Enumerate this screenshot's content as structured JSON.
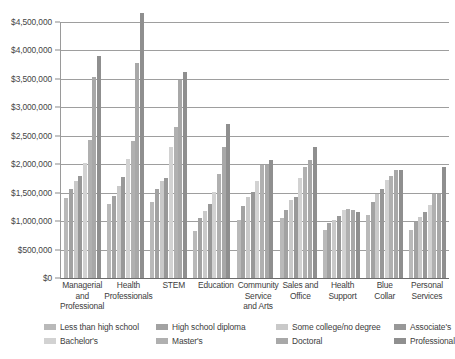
{
  "chart_data": {
    "type": "bar",
    "title": "",
    "subtitle": "",
    "xlabel": "",
    "ylabel": "",
    "ylim": [
      0,
      4500000
    ],
    "y_tick_labels": [
      "$0",
      "$500,000",
      "$1,000,000",
      "$1,500,000",
      "$2,000,000",
      "$2,500,000",
      "$3,000,000",
      "$3,500,000",
      "$4,000,000",
      "$4,500,000"
    ],
    "y_tick_values": [
      0,
      500000,
      1000000,
      1500000,
      2000000,
      2500000,
      3000000,
      3500000,
      4000000,
      4500000
    ],
    "grid": true,
    "legend_position": "bottom",
    "categories": [
      "Managerial and Professional",
      "Health Professionals",
      "STEM",
      "Education",
      "Community Service and Arts",
      "Sales and Office",
      "Health Support",
      "Blue Collar",
      "Personal Services"
    ],
    "category_lines": [
      [
        "Managerial",
        "and",
        "Professional"
      ],
      [
        "Health",
        "Professionals"
      ],
      [
        "STEM"
      ],
      [
        "Education"
      ],
      [
        "Community",
        "Service",
        "and Arts"
      ],
      [
        "Sales and",
        "Office"
      ],
      [
        "Health",
        "Support"
      ],
      [
        "Blue",
        "Collar"
      ],
      [
        "Personal",
        "Services"
      ]
    ],
    "series": [
      {
        "name": "Less than high school",
        "color": "#b9b9b9",
        "values": [
          1400000,
          1300000,
          1330000,
          830000,
          1020000,
          1060000,
          850000,
          1110000,
          850000
        ]
      },
      {
        "name": "High school diploma",
        "color": "#a2a2a2",
        "values": [
          1560000,
          1450000,
          1560000,
          1060000,
          1270000,
          1190000,
          960000,
          1330000,
          980000
        ]
      },
      {
        "name": "Some college/no degree",
        "color": "#c9c9c9",
        "values": [
          1700000,
          1620000,
          1700000,
          1180000,
          1430000,
          1370000,
          1020000,
          1480000,
          1080000
        ]
      },
      {
        "name": "Associate's",
        "color": "#989898",
        "values": [
          1790000,
          1770000,
          1760000,
          1300000,
          1520000,
          1420000,
          1090000,
          1560000,
          1160000
        ]
      },
      {
        "name": "Bachelor's",
        "color": "#d2d2d2",
        "values": [
          2030000,
          2090000,
          2300000,
          1520000,
          1710000,
          1750000,
          1190000,
          1720000,
          1280000
        ]
      },
      {
        "name": "Master's",
        "color": "#b0b0b0",
        "values": [
          2420000,
          2400000,
          2660000,
          1820000,
          1980000,
          1950000,
          1210000,
          1800000,
          1480000
        ]
      },
      {
        "name": "Doctoral",
        "color": "#a8a8a8",
        "values": [
          3530000,
          3780000,
          3480000,
          2300000,
          1980000,
          2070000,
          1200000,
          1890000,
          1470000
        ]
      },
      {
        "name": "Professional",
        "color": "#8f8f8f",
        "values": [
          3910000,
          4660000,
          3630000,
          2700000,
          2080000,
          2310000,
          1160000,
          1900000,
          1960000
        ]
      }
    ]
  },
  "legend": {
    "row1": [
      "Less than high school",
      "High school diploma",
      "Some college/no degree",
      "Associate's"
    ],
    "row2": [
      "Bachelor's",
      "Master's",
      "Doctoral",
      "Professional"
    ]
  }
}
